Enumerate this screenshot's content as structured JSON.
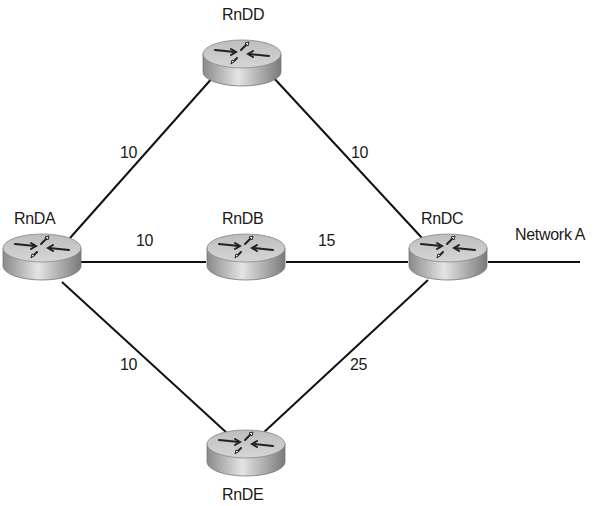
{
  "diagram": {
    "type": "network-topology",
    "routers": [
      {
        "id": "RnDD",
        "label": "RnDD",
        "icon": "router-icon"
      },
      {
        "id": "RnDA",
        "label": "RnDA",
        "icon": "router-icon"
      },
      {
        "id": "RnDB",
        "label": "RnDB",
        "icon": "router-icon"
      },
      {
        "id": "RnDC",
        "label": "RnDC",
        "icon": "router-icon"
      },
      {
        "id": "RnDE",
        "label": "RnDE",
        "icon": "router-icon"
      }
    ],
    "links": [
      {
        "from": "RnDA",
        "to": "RnDD",
        "cost": "10"
      },
      {
        "from": "RnDD",
        "to": "RnDC",
        "cost": "10"
      },
      {
        "from": "RnDA",
        "to": "RnDB",
        "cost": "10"
      },
      {
        "from": "RnDB",
        "to": "RnDC",
        "cost": "15"
      },
      {
        "from": "RnDA",
        "to": "RnDE",
        "cost": "10"
      },
      {
        "from": "RnDE",
        "to": "RnDC",
        "cost": "25"
      }
    ],
    "network": {
      "label": "Network A",
      "attached_to": "RnDC"
    },
    "colors": {
      "line": "#111111",
      "router_top": "#c8c8c8",
      "router_side": "#9a9a9a",
      "label": "#1a1a1a"
    }
  }
}
